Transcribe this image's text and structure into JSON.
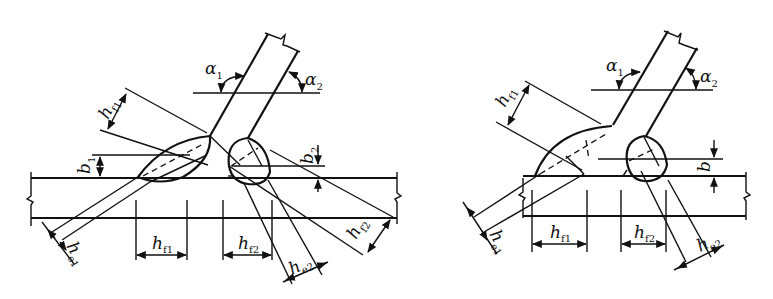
{
  "figure": {
    "panels": [
      {
        "id": "left",
        "description": "Inclined brace welded to plate with gap, weld sizes differ on each side",
        "labels": {
          "alpha1": {
            "base": "α",
            "sub": "1"
          },
          "alpha2": {
            "base": "α",
            "sub": "2"
          },
          "hf1_inclined": {
            "base": "h",
            "sub": "f1"
          },
          "b1": {
            "base": "b",
            "sub": "1"
          },
          "b2": {
            "base": "b",
            "sub": "2"
          },
          "he1": {
            "base": "h",
            "sub": "e1"
          },
          "hf1": {
            "base": "h",
            "sub": "f1"
          },
          "hf2": {
            "base": "h",
            "sub": "f2"
          },
          "he2": {
            "base": "h",
            "sub": "e2"
          },
          "hf2_inclined": {
            "base": "h",
            "sub": "f2"
          }
        }
      },
      {
        "id": "right",
        "description": "Inclined brace welded to plate, single gap dimension b",
        "labels": {
          "alpha1": {
            "base": "α",
            "sub": "1"
          },
          "alpha2": {
            "base": "α",
            "sub": "2"
          },
          "hf1_inclined": {
            "base": "h",
            "sub": "f1"
          },
          "b": {
            "base": "b",
            "sub": ""
          },
          "he1": {
            "base": "h",
            "sub": "e1"
          },
          "hf1": {
            "base": "h",
            "sub": "f1"
          },
          "hf2": {
            "base": "h",
            "sub": "f2"
          },
          "he2": {
            "base": "h",
            "sub": "e2"
          }
        }
      }
    ],
    "colors": {
      "line": "#111111",
      "background": "#ffffff"
    }
  }
}
